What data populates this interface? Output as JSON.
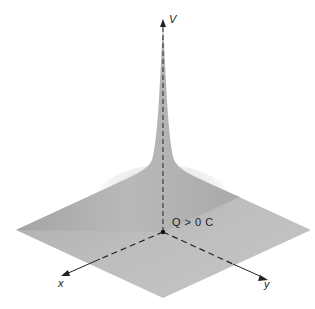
{
  "diagram": {
    "type": "3d-surface-potential-plot",
    "axes": {
      "v_label": "V",
      "x_label": "x",
      "y_label": "y"
    },
    "annotation": {
      "charge_label": "Q > 0 C"
    },
    "colors": {
      "surface": "#b8b8b8",
      "surface_light": "#c8c8c8",
      "axis": "#222222",
      "background": "#ffffff"
    }
  }
}
